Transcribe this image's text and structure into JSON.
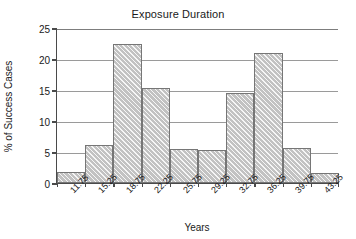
{
  "chart_data": {
    "type": "bar",
    "title": "Exposure Duration",
    "xlabel": "Years",
    "ylabel": "% of Success Cases",
    "categories": [
      "11.75",
      "15.25",
      "18.75",
      "22.25",
      "25.75",
      "29.25",
      "32.75",
      "36.25",
      "39.75",
      "43.25"
    ],
    "values": [
      1.7,
      6.1,
      22.5,
      15.3,
      5.5,
      5.4,
      14.5,
      20.9,
      5.6,
      1.6
    ],
    "ylim": [
      0,
      25
    ],
    "yticks": [
      0,
      5,
      10,
      15,
      20,
      25
    ],
    "ytick_labels": [
      "0",
      "5",
      "10",
      "15",
      "20",
      "25"
    ],
    "grid": true,
    "legend": false,
    "bar_fill_color": "#c2c2c2",
    "bar_edge_color": "#767676",
    "axis_color": "#4a4a4a",
    "grid_color": "#9a9a9a",
    "background_color": "#ffffff",
    "text_color": "#1a1a1a"
  }
}
